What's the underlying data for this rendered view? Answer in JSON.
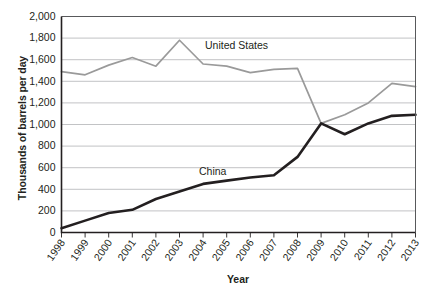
{
  "chart_data": {
    "type": "line",
    "title": "",
    "xlabel": "Year",
    "ylabel": "Thousands of barrels per day",
    "x": [
      1998,
      1999,
      2000,
      2001,
      2002,
      2003,
      2004,
      2005,
      2006,
      2007,
      2008,
      2009,
      2010,
      2011,
      2012,
      2013
    ],
    "xtick_labels": [
      "1998",
      "1999",
      "2000",
      "2001",
      "2002",
      "2003",
      "2004",
      "2005",
      "2006",
      "2007",
      "2008",
      "2009",
      "2010",
      "2011",
      "2012",
      "2013"
    ],
    "ytick_labels": [
      "0",
      "200",
      "400",
      "600",
      "800",
      "1,000",
      "1,200",
      "1,400",
      "1,600",
      "1,800",
      "2,000"
    ],
    "ytick_values": [
      0,
      200,
      400,
      600,
      800,
      1000,
      1200,
      1400,
      1600,
      1800,
      2000
    ],
    "ylim": [
      0,
      2000
    ],
    "grid": true,
    "legend_position": "inline-annotations",
    "series": [
      {
        "name": "United States",
        "color": "#9a9a9a",
        "annotation": "United States",
        "values": [
          1490,
          1460,
          1550,
          1620,
          1540,
          1780,
          1560,
          1540,
          1480,
          1510,
          1520,
          1010,
          1090,
          1200,
          1380,
          1350
        ]
      },
      {
        "name": "China",
        "color": "#231f20",
        "annotation": "China",
        "values": [
          40,
          110,
          180,
          210,
          310,
          380,
          450,
          480,
          510,
          530,
          700,
          1010,
          910,
          1010,
          1080,
          1090
        ]
      }
    ]
  }
}
